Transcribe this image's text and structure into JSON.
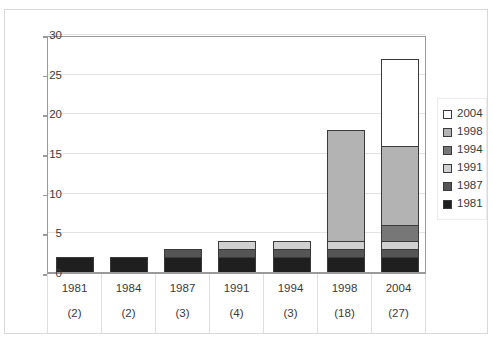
{
  "chart_data": {
    "type": "bar",
    "subtype": "stacked-column",
    "title": "",
    "xlabel": "",
    "ylabel": "",
    "ylim": [
      0,
      30
    ],
    "yticks": [
      0,
      5,
      10,
      15,
      20,
      25,
      30
    ],
    "grid": true,
    "legend_position": "right",
    "categories": [
      "1981",
      "1984",
      "1987",
      "1991",
      "1994",
      "1998",
      "2004"
    ],
    "category_counts": [
      "(2)",
      "(2)",
      "(3)",
      "(4)",
      "(3)",
      "(18)",
      "(27)"
    ],
    "totals": [
      2,
      2,
      3,
      4,
      4,
      18,
      27
    ],
    "series": [
      {
        "name": "1981",
        "color": "#1f1f1f",
        "values": [
          2,
          2,
          2,
          2,
          2,
          2,
          2
        ]
      },
      {
        "name": "1987",
        "color": "#555555",
        "values": [
          0,
          0,
          1,
          1,
          1,
          1,
          1
        ]
      },
      {
        "name": "1991",
        "color": "#d0d0d0",
        "values": [
          0,
          0,
          0,
          1,
          1,
          1,
          1
        ]
      },
      {
        "name": "1994",
        "color": "#777777",
        "values": [
          0,
          0,
          0,
          0,
          0,
          0,
          2
        ]
      },
      {
        "name": "1998",
        "color": "#b3b3b3",
        "values": [
          0,
          0,
          0,
          0,
          0,
          14,
          10
        ]
      },
      {
        "name": "2004",
        "color": "#ffffff",
        "values": [
          0,
          0,
          0,
          0,
          0,
          0,
          11
        ]
      }
    ],
    "legend": [
      {
        "label": "2004",
        "color": "#ffffff"
      },
      {
        "label": "1998",
        "color": "#b3b3b3"
      },
      {
        "label": "1994",
        "color": "#777777"
      },
      {
        "label": "1991",
        "color": "#d0d0d0"
      },
      {
        "label": "1987",
        "color": "#555555"
      },
      {
        "label": "1981",
        "color": "#1f1f1f"
      }
    ]
  }
}
